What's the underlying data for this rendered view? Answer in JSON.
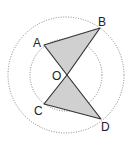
{
  "diagram": {
    "type": "geometry",
    "center": {
      "label": "O",
      "x": 67,
      "y": 75
    },
    "circles": [
      {
        "name": "outer-circle",
        "cx": 66,
        "cy": 75,
        "r": 58,
        "style": "dotted"
      },
      {
        "name": "inner-circle",
        "cx": 66,
        "cy": 75,
        "r": 36,
        "style": "dotted"
      }
    ],
    "points": {
      "A": {
        "x": 44,
        "y": 45
      },
      "B": {
        "x": 100,
        "y": 28
      },
      "O": {
        "x": 67,
        "y": 75
      },
      "C": {
        "x": 44,
        "y": 104
      },
      "D": {
        "x": 101,
        "y": 119
      }
    },
    "triangles": [
      {
        "name": "triangle-AOB",
        "vertices": [
          "A",
          "O",
          "B"
        ],
        "fill": "#d0d0d0"
      },
      {
        "name": "triangle-COD",
        "vertices": [
          "C",
          "O",
          "D"
        ],
        "fill": "#d0d0d0"
      }
    ],
    "labels": {
      "A": "A",
      "B": "B",
      "O": "O",
      "C": "C",
      "D": "D"
    },
    "colors": {
      "stroke": "#333333",
      "fill": "#d0d0d0",
      "circle": "#666666"
    }
  }
}
